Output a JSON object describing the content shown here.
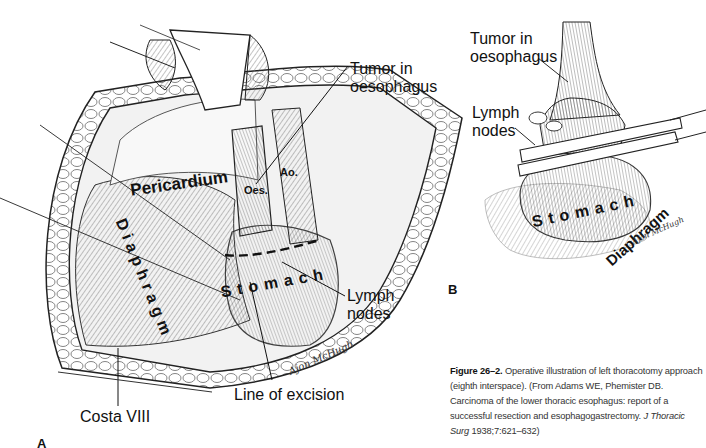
{
  "figure": {
    "number": "Figure 26–2.",
    "caption_text": "Operative illustration of left thoracotomy approach (eighth interspace). (From Adams WE, Phemister DB. Carcinoma of the lower thoracic esophagus: report of a successful resection and esophagogastrectomy.",
    "journal": "J Thoracic Surg",
    "citation_tail": "1938;7:621–632)"
  },
  "panel_a": {
    "letter": "A",
    "labels": {
      "tumor": "Tumor in\noesophagus",
      "tumor_line1": "Tumor in",
      "tumor_line2": "oesophagus",
      "lymph_line1": "Lymph",
      "lymph_line2": "nodes",
      "line_of_excision": "Line of excision",
      "costa": "Costa VIII"
    },
    "organs": {
      "pericardium": "Pericardium",
      "diaphragm": "Diaphragm",
      "stomach": "Stomach",
      "oesophagus_abbr": "Oes.",
      "aorta_abbr": "Ao."
    },
    "signature": "Ajon McHugh"
  },
  "panel_b": {
    "letter": "B",
    "labels": {
      "tumor_line1": "Tumor in",
      "tumor_line2": "oesophagus",
      "lymph_line1": "Lymph",
      "lymph_line2": "nodes"
    },
    "organs": {
      "stomach": "Stomach",
      "diaphragm": "Diaphragm"
    },
    "signature": "Ajon McHugh"
  }
}
